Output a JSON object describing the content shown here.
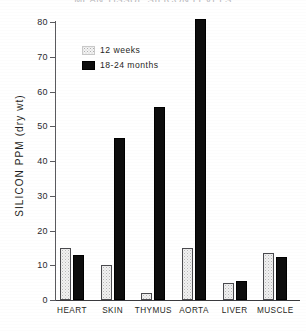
{
  "chart_data": {
    "type": "bar",
    "title": "MEAN TISSUE SILICON LEVELS",
    "xlabel": "",
    "ylabel": "SILICON PPM (dry wt)",
    "ylim": [
      0,
      80
    ],
    "yticks": [
      0,
      10,
      20,
      30,
      40,
      50,
      60,
      70,
      80
    ],
    "ytick_labels": [
      "0",
      "10",
      "20",
      "30",
      "40",
      "50",
      "60",
      "70",
      "80"
    ],
    "grid": false,
    "legend_position": "upper-left-inside",
    "categories": [
      "HEART",
      "SKIN",
      "THYMUS",
      "AORTA",
      "LIVER",
      "MUSCLE"
    ],
    "series": [
      {
        "name": "12 weeks",
        "swatch": "light-stipple",
        "color": "#f2f2f2",
        "values": [
          15,
          10,
          2,
          15,
          5,
          13.5
        ]
      },
      {
        "name": "18-24 months",
        "swatch": "solid-black",
        "color": "#0d0d0d",
        "values": [
          13,
          46.5,
          55.5,
          81,
          5.5,
          12.3
        ]
      }
    ]
  },
  "legend": {
    "items": [
      {
        "label": "12 weeks"
      },
      {
        "label": "18-24 months"
      }
    ]
  }
}
